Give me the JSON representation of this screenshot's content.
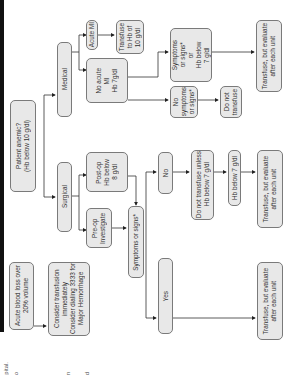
{
  "nodes": {
    "anemic": "Patient anemic?\n(Hb below 10 g/dl)",
    "medical": "Medical",
    "surgical": "Surgical",
    "acute_mi": "Acute MI",
    "transfuse_10": "Transfuse\nto Hb of\n10 g/dl",
    "no_acute_mi": "No acute\nMI\nHb 7g/dl",
    "symptoms_or_hb7": "Symptoms\nor signs*\nor\nHb below\n7 g/dl",
    "no_symptoms": "No\nsymptoms\nor signs*",
    "do_not_transfuse": "Do not\ntransfuse",
    "transfuse_eval_medical": "Transfuse, but evaluate\nafter each unit",
    "postop": "Post-op\nHb below\n8 g/dl",
    "preop": "Pre-op\nInvestigate",
    "symptoms_or_signs": "Symptoms or signs*",
    "no": "No",
    "yes": "Yes",
    "do_not_transfuse_unless": "Do not transfuse unless\nHb below 7 g/dl",
    "hb_below_7": "Hb below 7 g/dl",
    "transfuse_eval_no": "Transfuse, but evaluate\nafter each unit",
    "transfuse_eval_yes": "Transfuse, but evaluate\nafter each unit",
    "acute_blood_loss": "Acute blood loss over\n20% volume",
    "consider_transfusion": "Consider transfusion\nimmediately\nConsider dialing 3333 for\nMajor Hemorrhage"
  },
  "margin_fragments": {
    "a": "pital.",
    "b": "o",
    "c": "n",
    "d": "d"
  }
}
